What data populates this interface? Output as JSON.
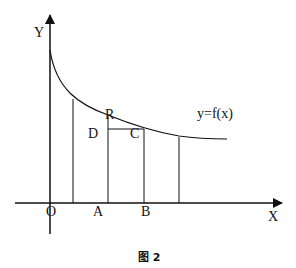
{
  "diagram": {
    "type": "function-graph",
    "axes": {
      "x_label": "X",
      "y_label": "Y",
      "origin_label": "O"
    },
    "curve": {
      "label": "y=f(x)",
      "shape": "decreasing, convex"
    },
    "points": {
      "A": "A",
      "B": "B",
      "R": "R",
      "D": "D",
      "C": "C"
    },
    "vertical_lines": 4,
    "caption": "图 2"
  }
}
